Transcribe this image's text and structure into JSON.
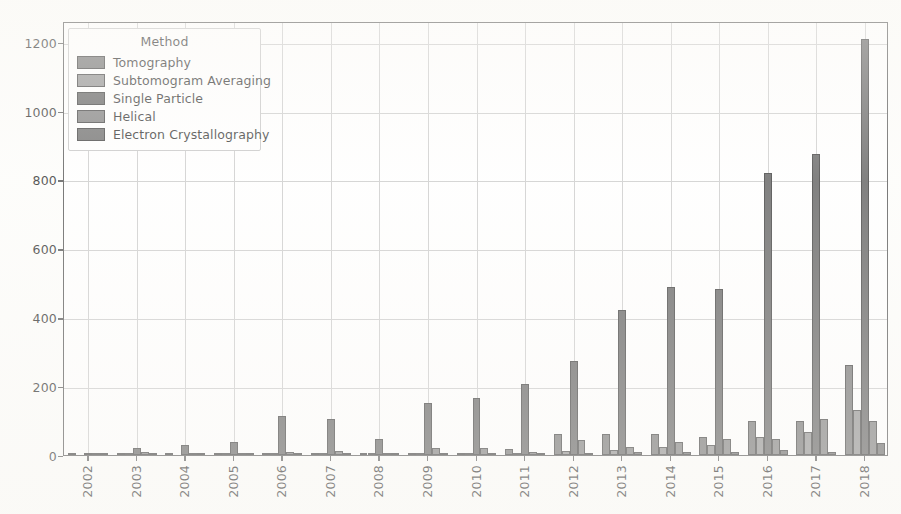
{
  "chart_data": {
    "type": "bar",
    "title": "",
    "xlabel": "",
    "ylabel": "",
    "ylim": [
      0,
      1260
    ],
    "yticks": [
      0,
      200,
      400,
      600,
      800,
      1000,
      1200
    ],
    "ytick_labels": [
      "0",
      "200",
      "400",
      "600",
      "800",
      "1000",
      "1200"
    ],
    "grid": true,
    "grid_axis": "both",
    "legend_position": "upper left",
    "legend_title": "Method",
    "categories": [
      "2002",
      "2003",
      "2004",
      "2005",
      "2006",
      "2007",
      "2008",
      "2009",
      "2010",
      "2011",
      "2012",
      "2013",
      "2014",
      "2015",
      "2016",
      "2017",
      "2018"
    ],
    "series": [
      {
        "name": "Tomography",
        "color": "#6b6b6b",
        "values": [
          1,
          3,
          2,
          2,
          3,
          3,
          4,
          7,
          6,
          18,
          60,
          61,
          60,
          53,
          100,
          99,
          262
        ]
      },
      {
        "name": "Subtomogram Averaging",
        "color": "#8a8a8a",
        "values": [
          0,
          1,
          0,
          1,
          2,
          2,
          2,
          4,
          4,
          6,
          12,
          14,
          24,
          30,
          52,
          66,
          131
        ]
      },
      {
        "name": "Single Particle",
        "color": "#585858",
        "values": [
          4,
          21,
          28,
          37,
          112,
          104,
          47,
          151,
          165,
          206,
          272,
          420,
          487,
          481,
          820,
          874,
          1208
        ]
      },
      {
        "name": "Helical",
        "color": "#777777",
        "values": [
          1,
          9,
          2,
          4,
          9,
          11,
          5,
          19,
          20,
          10,
          45,
          22,
          38,
          46,
          46,
          105,
          100
        ]
      },
      {
        "name": "Electron Crystallography",
        "color": "#636363",
        "values": [
          1,
          2,
          1,
          2,
          3,
          4,
          3,
          4,
          5,
          6,
          7,
          8,
          10,
          10,
          15,
          8,
          34
        ]
      }
    ]
  },
  "axes": {
    "plot_left": 63,
    "plot_top": 22,
    "plot_width": 825,
    "plot_height": 434
  }
}
